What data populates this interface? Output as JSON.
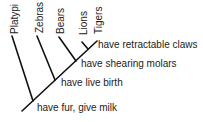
{
  "diagram": {
    "type": "cladogram",
    "taxa": [
      "Platypi",
      "Zebras",
      "Bears",
      "Lions",
      "Tigers"
    ],
    "traits": [
      "have retractable claws",
      "have shearing molars",
      "have live birth",
      "have fur, give milk"
    ],
    "line_color": "#111111"
  }
}
